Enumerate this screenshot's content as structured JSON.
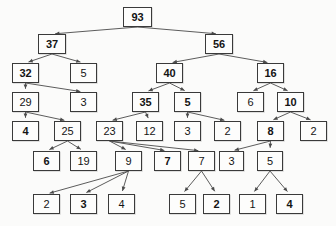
{
  "diagram": {
    "node_border_color": "#3a3a3a",
    "node_fill_color": "#fdfdfc",
    "edge_color": "#4a4a4a",
    "background_color": "#fbfbfa"
  },
  "chart_data": {
    "type": "diagram",
    "title": "",
    "nodes": [
      {
        "id": "n0",
        "label": "93",
        "bold": true,
        "x": 123,
        "y": 7,
        "w": 29,
        "h": 20,
        "level": 0
      },
      {
        "id": "n1",
        "label": "37",
        "bold": true,
        "x": 38,
        "y": 34,
        "w": 28,
        "h": 20,
        "level": 1
      },
      {
        "id": "n2",
        "label": "56",
        "bold": true,
        "x": 205,
        "y": 34,
        "w": 28,
        "h": 20,
        "level": 1
      },
      {
        "id": "n3",
        "label": "32",
        "bold": true,
        "x": 12,
        "y": 63,
        "w": 27,
        "h": 20,
        "level": 2
      },
      {
        "id": "n4",
        "label": "5",
        "bold": false,
        "x": 70,
        "y": 63,
        "w": 27,
        "h": 20,
        "level": 2
      },
      {
        "id": "n5",
        "label": "40",
        "bold": true,
        "x": 156,
        "y": 63,
        "w": 27,
        "h": 20,
        "level": 2
      },
      {
        "id": "n6",
        "label": "16",
        "bold": true,
        "x": 257,
        "y": 63,
        "w": 27,
        "h": 20,
        "level": 2
      },
      {
        "id": "n7",
        "label": "29",
        "bold": false,
        "x": 12,
        "y": 92,
        "w": 27,
        "h": 20,
        "level": 3
      },
      {
        "id": "n8",
        "label": "3",
        "bold": false,
        "x": 70,
        "y": 92,
        "w": 27,
        "h": 20,
        "level": 3
      },
      {
        "id": "n9",
        "label": "35",
        "bold": true,
        "x": 132,
        "y": 92,
        "w": 27,
        "h": 20,
        "level": 3
      },
      {
        "id": "n10",
        "label": "5",
        "bold": true,
        "x": 174,
        "y": 92,
        "w": 27,
        "h": 20,
        "level": 3
      },
      {
        "id": "n11",
        "label": "6",
        "bold": false,
        "x": 237,
        "y": 92,
        "w": 27,
        "h": 20,
        "level": 3
      },
      {
        "id": "n12",
        "label": "10",
        "bold": true,
        "x": 277,
        "y": 92,
        "w": 27,
        "h": 20,
        "level": 3
      },
      {
        "id": "n13",
        "label": "4",
        "bold": true,
        "x": 12,
        "y": 121,
        "w": 27,
        "h": 20,
        "level": 4
      },
      {
        "id": "n14",
        "label": "25",
        "bold": false,
        "x": 54,
        "y": 121,
        "w": 27,
        "h": 20,
        "level": 4
      },
      {
        "id": "n15",
        "label": "23",
        "bold": false,
        "x": 96,
        "y": 121,
        "w": 27,
        "h": 20,
        "level": 4
      },
      {
        "id": "n16",
        "label": "12",
        "bold": false,
        "x": 136,
        "y": 121,
        "w": 27,
        "h": 20,
        "level": 4
      },
      {
        "id": "n17",
        "label": "3",
        "bold": false,
        "x": 174,
        "y": 121,
        "w": 27,
        "h": 20,
        "level": 4
      },
      {
        "id": "n18",
        "label": "2",
        "bold": false,
        "x": 214,
        "y": 121,
        "w": 27,
        "h": 20,
        "level": 4
      },
      {
        "id": "n19",
        "label": "8",
        "bold": true,
        "x": 257,
        "y": 121,
        "w": 27,
        "h": 20,
        "level": 4
      },
      {
        "id": "n20",
        "label": "2",
        "bold": false,
        "x": 300,
        "y": 121,
        "w": 27,
        "h": 20,
        "level": 4
      },
      {
        "id": "n21",
        "label": "6",
        "bold": true,
        "x": 33,
        "y": 151,
        "w": 27,
        "h": 20,
        "level": 5
      },
      {
        "id": "n22",
        "label": "19",
        "bold": false,
        "x": 70,
        "y": 151,
        "w": 27,
        "h": 20,
        "level": 5
      },
      {
        "id": "n23",
        "label": "9",
        "bold": false,
        "x": 115,
        "y": 151,
        "w": 27,
        "h": 20,
        "level": 5
      },
      {
        "id": "n24",
        "label": "7",
        "bold": true,
        "x": 154,
        "y": 151,
        "w": 27,
        "h": 20,
        "level": 5
      },
      {
        "id": "n25",
        "label": "7",
        "bold": false,
        "x": 188,
        "y": 151,
        "w": 27,
        "h": 20,
        "level": 5
      },
      {
        "id": "n26",
        "label": "3",
        "bold": false,
        "x": 219,
        "y": 151,
        "w": 25,
        "h": 20,
        "level": 5
      },
      {
        "id": "n27",
        "label": "5",
        "bold": false,
        "x": 257,
        "y": 151,
        "w": 26,
        "h": 20,
        "level": 5
      },
      {
        "id": "n28",
        "label": "2",
        "bold": false,
        "x": 33,
        "y": 194,
        "w": 27,
        "h": 20,
        "level": 6
      },
      {
        "id": "n29",
        "label": "3",
        "bold": true,
        "x": 70,
        "y": 194,
        "w": 27,
        "h": 20,
        "level": 6
      },
      {
        "id": "n30",
        "label": "4",
        "bold": false,
        "x": 108,
        "y": 194,
        "w": 27,
        "h": 20,
        "level": 6
      },
      {
        "id": "n31",
        "label": "5",
        "bold": false,
        "x": 169,
        "y": 194,
        "w": 27,
        "h": 20,
        "level": 6
      },
      {
        "id": "n32",
        "label": "2",
        "bold": true,
        "x": 203,
        "y": 194,
        "w": 27,
        "h": 20,
        "level": 6
      },
      {
        "id": "n33",
        "label": "1",
        "bold": false,
        "x": 239,
        "y": 194,
        "w": 27,
        "h": 20,
        "level": 6
      },
      {
        "id": "n34",
        "label": "4",
        "bold": true,
        "x": 276,
        "y": 194,
        "w": 27,
        "h": 20,
        "level": 6
      }
    ],
    "edges": [
      {
        "from": "n0",
        "to": "n1"
      },
      {
        "from": "n0",
        "to": "n2"
      },
      {
        "from": "n1",
        "to": "n3"
      },
      {
        "from": "n1",
        "to": "n4"
      },
      {
        "from": "n2",
        "to": "n5"
      },
      {
        "from": "n2",
        "to": "n6"
      },
      {
        "from": "n3",
        "to": "n7"
      },
      {
        "from": "n3",
        "to": "n8"
      },
      {
        "from": "n5",
        "to": "n9"
      },
      {
        "from": "n5",
        "to": "n10"
      },
      {
        "from": "n6",
        "to": "n11"
      },
      {
        "from": "n6",
        "to": "n12"
      },
      {
        "from": "n7",
        "to": "n13"
      },
      {
        "from": "n7",
        "to": "n14"
      },
      {
        "from": "n9",
        "to": "n15"
      },
      {
        "from": "n9",
        "to": "n16"
      },
      {
        "from": "n10",
        "to": "n17"
      },
      {
        "from": "n10",
        "to": "n18"
      },
      {
        "from": "n12",
        "to": "n19"
      },
      {
        "from": "n12",
        "to": "n20"
      },
      {
        "from": "n14",
        "to": "n21"
      },
      {
        "from": "n14",
        "to": "n22"
      },
      {
        "from": "n15",
        "to": "n23"
      },
      {
        "from": "n15",
        "to": "n24"
      },
      {
        "from": "n15",
        "to": "n25"
      },
      {
        "from": "n19",
        "to": "n26"
      },
      {
        "from": "n19",
        "to": "n27"
      },
      {
        "from": "n23",
        "to": "n28"
      },
      {
        "from": "n23",
        "to": "n29"
      },
      {
        "from": "n23",
        "to": "n30"
      },
      {
        "from": "n25",
        "to": "n31"
      },
      {
        "from": "n25",
        "to": "n32"
      },
      {
        "from": "n27",
        "to": "n33"
      },
      {
        "from": "n27",
        "to": "n34"
      }
    ]
  }
}
